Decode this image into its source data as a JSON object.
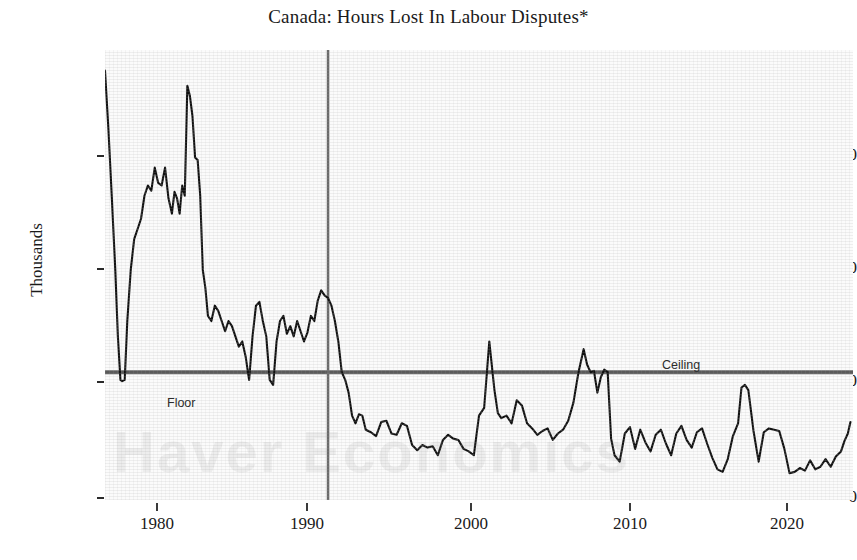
{
  "chart_data": {
    "type": "line",
    "title": "Canada: Hours Lost In Labour Disputes*",
    "xlabel": "",
    "ylabel": "Thousands",
    "xlim": [
      1977.0,
      2020.6
    ],
    "ylim": [
      0,
      1760
    ],
    "yticks": [
      0,
      500,
      1000,
      1500
    ],
    "ytick_labels": [
      "0",
      "500",
      "1000",
      "1500"
    ],
    "xticks": [
      1980,
      1990,
      2000,
      2010,
      2020
    ],
    "xtick_labels": [
      "1980",
      "1990",
      "2000",
      "2010",
      "2020"
    ],
    "grid": false,
    "legend": "none",
    "line_color": "#111111",
    "annotations": [
      {
        "label": "Floor",
        "x": 1981.2,
        "y": 435,
        "placement": "below-line"
      },
      {
        "label": "Ceiling",
        "x": 2013.0,
        "y": 560,
        "placement": "above-line"
      }
    ],
    "reference_lines": [
      {
        "name": "horizontal-level",
        "orientation": "horizontal",
        "value": 500,
        "color": "#5a5a5a"
      },
      {
        "name": "vertical-marker-1990",
        "orientation": "vertical",
        "value": 1990,
        "color": "#6a6a6a"
      }
    ],
    "watermark_text": "Haver Economics",
    "series": [
      {
        "name": "Hours Lost In Labour Disputes",
        "units": "Thousands",
        "x": [
          1977.0,
          1977.2,
          1977.4,
          1977.6,
          1977.75,
          1977.9,
          1978.0,
          1978.15,
          1978.3,
          1978.5,
          1978.7,
          1978.9,
          1979.1,
          1979.3,
          1979.5,
          1979.7,
          1979.9,
          1980.1,
          1980.3,
          1980.5,
          1980.7,
          1980.9,
          1981.05,
          1981.2,
          1981.35,
          1981.5,
          1981.65,
          1981.8,
          1981.95,
          1982.1,
          1982.25,
          1982.4,
          1982.55,
          1982.7,
          1982.85,
          1983.0,
          1983.2,
          1983.4,
          1983.6,
          1983.8,
          1984.0,
          1984.2,
          1984.4,
          1984.6,
          1984.8,
          1985.0,
          1985.2,
          1985.4,
          1985.6,
          1985.8,
          1986.0,
          1986.2,
          1986.4,
          1986.6,
          1986.8,
          1987.0,
          1987.2,
          1987.4,
          1987.6,
          1987.8,
          1988.0,
          1988.2,
          1988.4,
          1988.6,
          1988.8,
          1989.0,
          1989.2,
          1989.4,
          1989.6,
          1989.8,
          1990.0,
          1990.2,
          1990.4,
          1990.6,
          1990.8,
          1991.0,
          1991.2,
          1991.4,
          1991.6,
          1991.8,
          1992.0,
          1992.2,
          1992.5,
          1992.8,
          1993.1,
          1993.4,
          1993.7,
          1994.0,
          1994.3,
          1994.6,
          1994.9,
          1995.2,
          1995.5,
          1995.8,
          1996.1,
          1996.4,
          1996.7,
          1997.0,
          1997.3,
          1997.6,
          1997.9,
          1998.2,
          1998.5,
          1998.8,
          1999.1,
          1999.4,
          1999.7,
          1999.9,
          2000.1,
          2000.4,
          2000.7,
          2001.0,
          2001.3,
          2001.6,
          2001.9,
          2002.2,
          2002.5,
          2002.8,
          2003.1,
          2003.4,
          2003.7,
          2004.0,
          2004.3,
          2004.6,
          2004.9,
          2005.1,
          2005.3,
          2005.5,
          2005.7,
          2005.9,
          2006.1,
          2006.3,
          2006.5,
          2006.7,
          2007.0,
          2007.3,
          2007.6,
          2007.9,
          2008.2,
          2008.5,
          2008.8,
          2009.1,
          2009.4,
          2009.7,
          2010.0,
          2010.3,
          2010.6,
          2010.9,
          2011.2,
          2011.5,
          2011.8,
          2012.1,
          2012.4,
          2012.7,
          2013.0,
          2013.3,
          2013.6,
          2013.9,
          2014.1,
          2014.3,
          2014.5,
          2014.8,
          2015.1,
          2015.4,
          2015.7,
          2016.0,
          2016.3,
          2016.6,
          2016.9,
          2017.2,
          2017.5,
          2017.8,
          2018.1,
          2018.4,
          2018.7,
          2019.0,
          2019.3,
          2019.6,
          2019.9,
          2020.1,
          2020.3,
          2020.45
        ],
        "values": [
          1680,
          1450,
          1180,
          900,
          640,
          470,
          465,
          470,
          700,
          900,
          1020,
          1060,
          1100,
          1190,
          1230,
          1210,
          1300,
          1240,
          1230,
          1300,
          1180,
          1120,
          1205,
          1180,
          1120,
          1230,
          1190,
          1620,
          1580,
          1500,
          1340,
          1330,
          1190,
          900,
          830,
          720,
          700,
          760,
          740,
          700,
          660,
          700,
          680,
          640,
          600,
          620,
          560,
          470,
          640,
          760,
          775,
          700,
          640,
          470,
          450,
          620,
          700,
          720,
          650,
          680,
          640,
          700,
          660,
          620,
          655,
          720,
          700,
          780,
          820,
          800,
          790,
          760,
          700,
          620,
          500,
          470,
          420,
          330,
          300,
          335,
          330,
          275,
          265,
          250,
          305,
          310,
          260,
          255,
          300,
          290,
          215,
          195,
          215,
          205,
          210,
          175,
          235,
          255,
          240,
          235,
          200,
          190,
          175,
          330,
          360,
          620,
          430,
          340,
          320,
          330,
          300,
          390,
          370,
          300,
          280,
          255,
          270,
          280,
          235,
          260,
          275,
          310,
          380,
          500,
          590,
          530,
          500,
          505,
          420,
          480,
          510,
          500,
          240,
          175,
          150,
          260,
          285,
          200,
          275,
          225,
          190,
          255,
          275,
          220,
          175,
          260,
          290,
          235,
          205,
          265,
          280,
          220,
          165,
          120,
          110,
          160,
          250,
          300,
          440,
          450,
          430,
          270,
          150,
          265,
          280,
          275,
          270,
          200,
          105,
          110,
          125,
          115,
          155,
          120,
          130,
          160,
          130,
          170,
          190,
          230,
          260,
          305
        ]
      }
    ]
  },
  "axis": {
    "title": "Canada: Hours Lost In Labour Disputes*",
    "ylabel": "Thousands",
    "ytick_labels": [
      "1500",
      "1000",
      "500",
      "0"
    ],
    "xtick_labels": [
      "1980",
      "1990",
      "2000",
      "2010",
      "2020"
    ]
  },
  "annotations": {
    "floor": "Floor",
    "ceiling": "Ceiling"
  },
  "watermark": {
    "text": "Haver Economics"
  },
  "colors": {
    "line": "#111111",
    "reference": "#5a5a5a",
    "vertical_marker": "#6a6a6a",
    "text": "#1a1a1a",
    "plot_background": "#fbfbfb"
  }
}
